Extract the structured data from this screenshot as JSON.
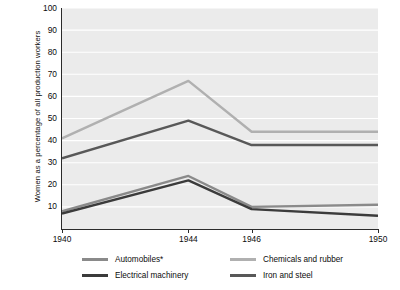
{
  "chart_data": {
    "type": "line",
    "title": "",
    "xlabel": "",
    "ylabel": "Women as a percentage of all production workers",
    "x": [
      1940,
      1944,
      1946,
      1950
    ],
    "xticklabels": [
      "1940",
      "1944",
      "1946",
      "1950"
    ],
    "yticklabels": [
      "100",
      "90",
      "80",
      "70",
      "60",
      "50",
      "40",
      "30",
      "20",
      "10"
    ],
    "ylim": [
      0,
      100
    ],
    "xlim": [
      1940,
      1950
    ],
    "ytick_step": 10,
    "grid": true,
    "grid_axis": "y",
    "legend_position": "below-plot",
    "legend_columns": 2,
    "plot_background": "#ebebeb",
    "series": [
      {
        "name": "Automobiles*",
        "color": "#8a8a8a",
        "values": [
          8,
          24,
          10,
          11
        ]
      },
      {
        "name": "Electrical machinery",
        "color": "#3b3b3b",
        "values": [
          7,
          22,
          9,
          6
        ]
      },
      {
        "name": "Chemicals and rubber",
        "color": "#b0b0b0",
        "values": [
          41,
          67,
          44,
          44
        ]
      },
      {
        "name": "Iron and steel",
        "color": "#585858",
        "values": [
          32,
          49,
          38,
          38
        ]
      }
    ]
  }
}
